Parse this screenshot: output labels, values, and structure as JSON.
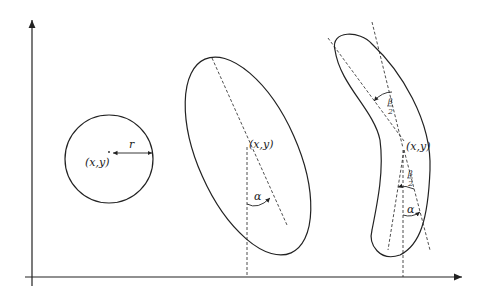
{
  "diagram": {
    "shapes": [
      {
        "type": "circle",
        "center_label": "(x,y)",
        "radius_label": "r"
      },
      {
        "type": "ellipse",
        "center_label": "(x,y)",
        "angle_label": "α"
      },
      {
        "type": "curved",
        "center_label": "(x,y)",
        "angle_label": "α",
        "half_bend_top": {
          "num": "β",
          "den": "2"
        },
        "half_bend_bottom": {
          "num": "β",
          "den": "2"
        }
      }
    ],
    "colors": {
      "stroke": "#222222",
      "background": "#ffffff"
    }
  }
}
